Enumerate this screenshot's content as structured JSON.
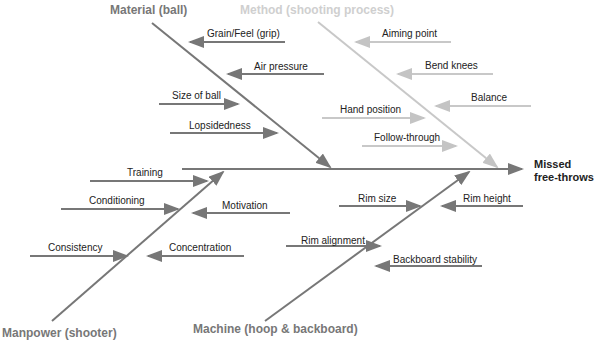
{
  "diagram": {
    "type": "fishbone",
    "effect": {
      "line1": "Missed",
      "line2": "free-throws"
    },
    "categories": {
      "material": {
        "label": "Material (ball)",
        "color": "#777777",
        "causes": [
          "Grain/Feel (grip)",
          "Air pressure",
          "Size of ball",
          "Lopsidedness"
        ]
      },
      "method": {
        "label": "Method (shooting process)",
        "color": "#c8c8c8",
        "causes": [
          "Aiming point",
          "Bend knees",
          "Balance",
          "Hand position",
          "Follow-through"
        ]
      },
      "manpower": {
        "label": "Manpower (shooter)",
        "color": "#777777",
        "causes": [
          "Training",
          "Conditioning",
          "Motivation",
          "Consistency",
          "Concentration"
        ]
      },
      "machine": {
        "label": "Machine (hoop & backboard)",
        "color": "#777777",
        "causes": [
          "Rim size",
          "Rim height",
          "Rim alignment",
          "Backboard stability"
        ]
      }
    }
  }
}
